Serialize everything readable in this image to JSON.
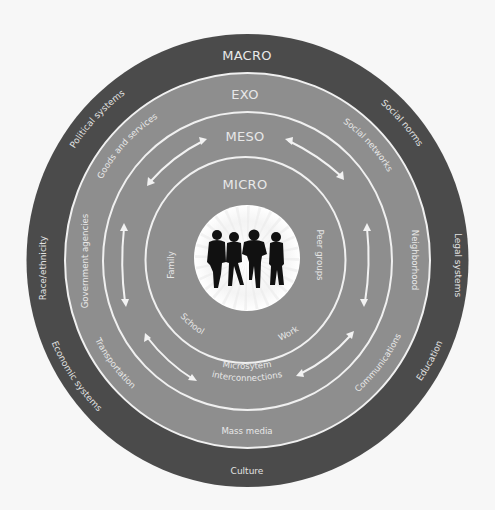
{
  "diagram": {
    "colors": {
      "background": "#f7f7f7",
      "macro_ring": "#4b4b4b",
      "inner_rings": "#8e8e8e",
      "ring_lines": "#f0f0f0",
      "text": "#e8e8e8",
      "center_disc": "#ffffff",
      "silhouettes": "#111111"
    },
    "levels": {
      "macro": {
        "title": "MACRO",
        "items": [
          "Social norms",
          "Legal systems",
          "Education",
          "Culture",
          "Economic systems",
          "Race/ethnicity",
          "Political systems"
        ]
      },
      "exo": {
        "title": "EXO",
        "items": [
          "Social networks",
          "Neighborhood",
          "Communications",
          "Mass media",
          "Transportation",
          "Government agencies",
          "Goods and services"
        ]
      },
      "meso": {
        "title": "MESO",
        "center_label_line1": "Microsytem",
        "center_label_line2": "interconnections"
      },
      "micro": {
        "title": "MICRO",
        "items": [
          "Family",
          "Peer groups",
          "School",
          "Work"
        ]
      }
    },
    "center": {
      "icon": "people-group-silhouette-icon",
      "people_count": 4
    },
    "arrows": {
      "icon": "double-headed-arrow-icon",
      "count": 6
    }
  }
}
